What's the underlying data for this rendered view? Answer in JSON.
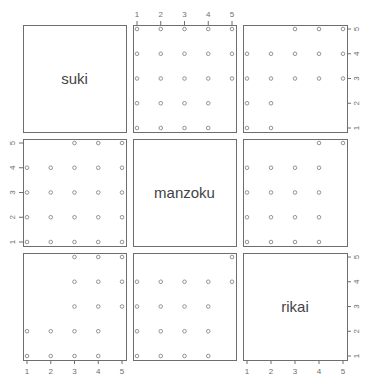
{
  "chart_data": {
    "type": "scatter",
    "title": "",
    "subtitle": "pairs plot (scatterplot matrix)",
    "variables": [
      "suki",
      "manzoku",
      "rikai"
    ],
    "axis_range": [
      1,
      5
    ],
    "tick_labels": [
      "1",
      "2",
      "3",
      "4",
      "5"
    ],
    "grid": false,
    "legend": null,
    "panels": [
      {
        "row": 0,
        "col": 1,
        "x_var": "manzoku",
        "y_var": "suki",
        "points": [
          [
            1,
            5
          ],
          [
            2,
            5
          ],
          [
            3,
            5
          ],
          [
            4,
            5
          ],
          [
            5,
            5
          ],
          [
            1,
            4
          ],
          [
            2,
            4
          ],
          [
            3,
            4
          ],
          [
            4,
            4
          ],
          [
            5,
            4
          ],
          [
            1,
            3
          ],
          [
            2,
            3
          ],
          [
            3,
            3
          ],
          [
            4,
            3
          ],
          [
            5,
            3
          ],
          [
            1,
            2
          ],
          [
            2,
            2
          ],
          [
            3,
            2
          ],
          [
            4,
            2
          ],
          [
            1,
            1
          ],
          [
            2,
            1
          ],
          [
            3,
            1
          ],
          [
            4,
            1
          ]
        ]
      },
      {
        "row": 0,
        "col": 2,
        "x_var": "rikai",
        "y_var": "suki",
        "points": [
          [
            3,
            5
          ],
          [
            4,
            5
          ],
          [
            5,
            5
          ],
          [
            1,
            4
          ],
          [
            2,
            4
          ],
          [
            3,
            4
          ],
          [
            4,
            4
          ],
          [
            5,
            4
          ],
          [
            1,
            3
          ],
          [
            2,
            3
          ],
          [
            3,
            3
          ],
          [
            4,
            3
          ],
          [
            5,
            3
          ],
          [
            1,
            2
          ],
          [
            2,
            2
          ],
          [
            1,
            1
          ],
          [
            2,
            1
          ]
        ]
      },
      {
        "row": 1,
        "col": 0,
        "x_var": "suki",
        "y_var": "manzoku",
        "points": [
          [
            3,
            5
          ],
          [
            4,
            5
          ],
          [
            5,
            5
          ],
          [
            1,
            4
          ],
          [
            2,
            4
          ],
          [
            3,
            4
          ],
          [
            4,
            4
          ],
          [
            5,
            4
          ],
          [
            1,
            3
          ],
          [
            2,
            3
          ],
          [
            3,
            3
          ],
          [
            4,
            3
          ],
          [
            5,
            3
          ],
          [
            1,
            2
          ],
          [
            2,
            2
          ],
          [
            3,
            2
          ],
          [
            4,
            2
          ],
          [
            5,
            2
          ],
          [
            1,
            1
          ],
          [
            2,
            1
          ],
          [
            3,
            1
          ],
          [
            4,
            1
          ],
          [
            5,
            1
          ]
        ]
      },
      {
        "row": 1,
        "col": 2,
        "x_var": "rikai",
        "y_var": "manzoku",
        "points": [
          [
            4,
            5
          ],
          [
            5,
            5
          ],
          [
            1,
            4
          ],
          [
            2,
            4
          ],
          [
            3,
            4
          ],
          [
            4,
            4
          ],
          [
            1,
            3
          ],
          [
            2,
            3
          ],
          [
            3,
            3
          ],
          [
            4,
            3
          ],
          [
            1,
            2
          ],
          [
            2,
            2
          ],
          [
            3,
            2
          ],
          [
            4,
            2
          ],
          [
            1,
            1
          ],
          [
            2,
            1
          ],
          [
            3,
            1
          ],
          [
            4,
            1
          ]
        ]
      },
      {
        "row": 2,
        "col": 0,
        "x_var": "suki",
        "y_var": "rikai",
        "points": [
          [
            3,
            5
          ],
          [
            4,
            5
          ],
          [
            5,
            5
          ],
          [
            3,
            4
          ],
          [
            4,
            4
          ],
          [
            5,
            4
          ],
          [
            3,
            3
          ],
          [
            4,
            3
          ],
          [
            5,
            3
          ],
          [
            1,
            2
          ],
          [
            2,
            2
          ],
          [
            3,
            2
          ],
          [
            4,
            2
          ],
          [
            1,
            1
          ],
          [
            2,
            1
          ],
          [
            3,
            1
          ],
          [
            4,
            1
          ]
        ]
      },
      {
        "row": 2,
        "col": 1,
        "x_var": "manzoku",
        "y_var": "rikai",
        "points": [
          [
            5,
            5
          ],
          [
            1,
            4
          ],
          [
            2,
            4
          ],
          [
            3,
            4
          ],
          [
            4,
            4
          ],
          [
            5,
            4
          ],
          [
            1,
            3
          ],
          [
            2,
            3
          ],
          [
            3,
            3
          ],
          [
            4,
            3
          ],
          [
            1,
            2
          ],
          [
            2,
            2
          ],
          [
            3,
            2
          ],
          [
            4,
            2
          ],
          [
            1,
            1
          ],
          [
            2,
            1
          ],
          [
            3,
            1
          ],
          [
            4,
            1
          ]
        ]
      }
    ],
    "axes": {
      "top": {
        "columns": [
          1
        ],
        "labels": [
          "1",
          "2",
          "3",
          "4",
          "5"
        ]
      },
      "bottom": {
        "columns": [
          0,
          2
        ],
        "labels": [
          "1",
          "2",
          "3",
          "4",
          "5"
        ]
      },
      "left": {
        "rows": [
          1
        ],
        "labels": [
          "1",
          "2",
          "3",
          "4",
          "5"
        ]
      },
      "right": {
        "rows": [
          0,
          2
        ],
        "labels": [
          "1",
          "2",
          "3",
          "4",
          "5"
        ]
      }
    }
  },
  "colors": {
    "frame": "#6e6e6e",
    "point": "#7a7a7a",
    "label": "#444444",
    "background": "#ffffff"
  }
}
